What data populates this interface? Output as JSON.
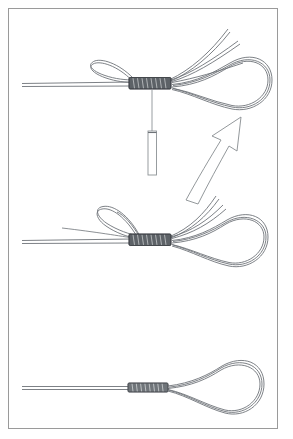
{
  "document": {
    "title": "Loop Knot Tying Sequence",
    "kind": "technical-line-illustration",
    "width": 293,
    "height": 439
  },
  "frame": {
    "border_color": "#9a9a9a",
    "border_width": 1,
    "fill_color": "#ffffff",
    "x": 8,
    "y": 8,
    "width": 270,
    "height": 421
  },
  "style": {
    "line_color": "#6e7378",
    "line_color_dark": "#4a4f54",
    "wrap_fill": "#5d6267",
    "wrap_stroke": "#3a3e42",
    "arrow_stroke": "#8d9296",
    "arrow_fill": "#ffffff",
    "needle_stroke": "#8d9296",
    "background": "#ffffff"
  },
  "panels": [
    {
      "id": "panel-top",
      "name": "step-1-pulling-tag-through",
      "order": 1,
      "center_y": 84,
      "knot": {
        "x": 150,
        "y": 84,
        "wrap_count": 9,
        "width": 42,
        "height": 13
      },
      "standing_line": {
        "from_x": 22,
        "to_x": 128,
        "y": 85
      },
      "loop": {
        "apex_x": 255,
        "apex_y": 82,
        "width": 96,
        "height": 56
      },
      "free_ends": 3,
      "small_loop": {
        "present": true,
        "side": "left-top"
      },
      "needle": {
        "present": true,
        "top_y": 96,
        "bottom_y": 175,
        "body_top_y": 131,
        "x": 152,
        "body_width": 8,
        "shaft_width": 1
      }
    },
    {
      "id": "panel-middle",
      "name": "step-2-seating-the-wraps",
      "order": 2,
      "center_y": 239,
      "knot": {
        "x": 150,
        "y": 240,
        "wrap_count": 9,
        "width": 42,
        "height": 13
      },
      "standing_line": {
        "from_x": 22,
        "to_x": 128,
        "y": 241
      },
      "loop": {
        "apex_x": 252,
        "apex_y": 238,
        "width": 94,
        "height": 54
      },
      "free_ends": 3,
      "small_loop": {
        "present": true,
        "side": "left-top"
      }
    },
    {
      "id": "panel-bottom",
      "name": "step-3-finished-knot",
      "order": 3,
      "center_y": 388,
      "knot": {
        "x": 148,
        "y": 388,
        "wrap_count": 9,
        "width": 40,
        "height": 9
      },
      "standing_line": {
        "from_x": 22,
        "to_x": 128,
        "y": 388
      },
      "loop": {
        "apex_x": 248,
        "apex_y": 388,
        "width": 92,
        "height": 52
      },
      "free_ends": 0,
      "small_loop": {
        "present": false
      }
    }
  ],
  "arrow": {
    "name": "step-transition-arrow",
    "direction": "up",
    "from": {
      "x": 198,
      "y": 196
    },
    "to": {
      "x": 237,
      "y": 122
    },
    "label": "",
    "style": "hollow-outline-curved"
  },
  "labels": {
    "none": ""
  }
}
